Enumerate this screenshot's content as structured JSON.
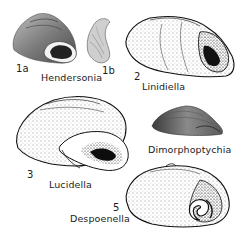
{
  "figure": {
    "specimens": [
      {
        "id": "1a",
        "number_label": "1a",
        "genus": ""
      },
      {
        "id": "1b",
        "number_label": "1b",
        "genus": "Hendersonia"
      },
      {
        "id": "2",
        "number_label": "2",
        "genus": "Linidiella"
      },
      {
        "id": "4",
        "number_label": "",
        "genus": "Dimorphoptychia"
      },
      {
        "id": "3",
        "number_label": "3",
        "genus": "Lucidella"
      },
      {
        "id": "5",
        "number_label": "5",
        "genus": "Despoenella"
      }
    ],
    "colors": {
      "background": "#ffffff",
      "ink": "#1a1a1a",
      "shade_gray": "#7a7a7a"
    }
  }
}
